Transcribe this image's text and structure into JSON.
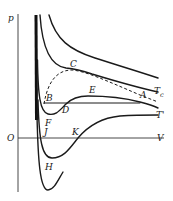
{
  "diagram": {
    "title": "",
    "axes": {
      "y_label": "p",
      "x_label": "V",
      "origin_label": "O"
    },
    "isotherm_labels": {
      "critical": "T",
      "critical_sub": "c",
      "low": "T'"
    },
    "point_labels": {
      "A": "A",
      "B": "B",
      "C": "C",
      "D": "D",
      "E": "E",
      "F": "F",
      "H": "H",
      "J": "J",
      "K": "K"
    }
  }
}
